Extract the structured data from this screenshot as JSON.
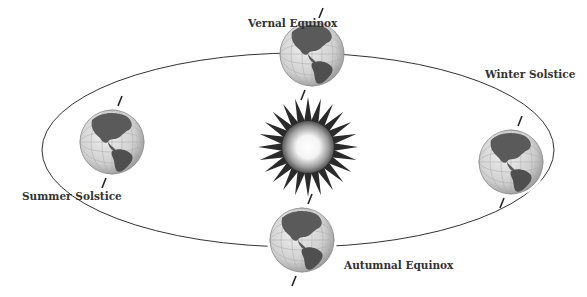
{
  "labels": {
    "vernal": "Vernal Equinox",
    "summer": "Summer Solstice",
    "winter": "Winter Solstice",
    "autumnal": "Autumnal Equinox"
  },
  "colors": {
    "orbit": "#333333",
    "label": "#333333",
    "sun_rays": "#2a2a2a",
    "ocean": "#d9d9d9",
    "land": "#5a5a5a"
  },
  "icons": {
    "sun": "sun-icon",
    "globe": "globe-icon"
  }
}
